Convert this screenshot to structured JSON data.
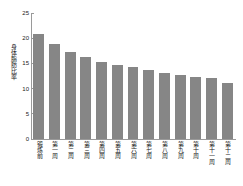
{
  "chart_data": {
    "type": "bar",
    "title": "",
    "xlabel": "",
    "ylabel": "身体脂肪比率",
    "ylim": [
      0,
      25
    ],
    "yticks": [
      0,
      5,
      10,
      15,
      20,
      25
    ],
    "grid": false,
    "legend": null,
    "bar_color": "#868686",
    "categories": [
      "锻炼前",
      "第一周",
      "第二周",
      "第三周",
      "第四周",
      "第五周",
      "第六周",
      "第七周",
      "第八周",
      "第九周",
      "第十周",
      "第十一周",
      "第十二周"
    ],
    "values": [
      20.8,
      18.8,
      17.2,
      16.2,
      15.3,
      14.7,
      14.2,
      13.6,
      13.1,
      12.7,
      12.4,
      12.1,
      11.2
    ]
  }
}
